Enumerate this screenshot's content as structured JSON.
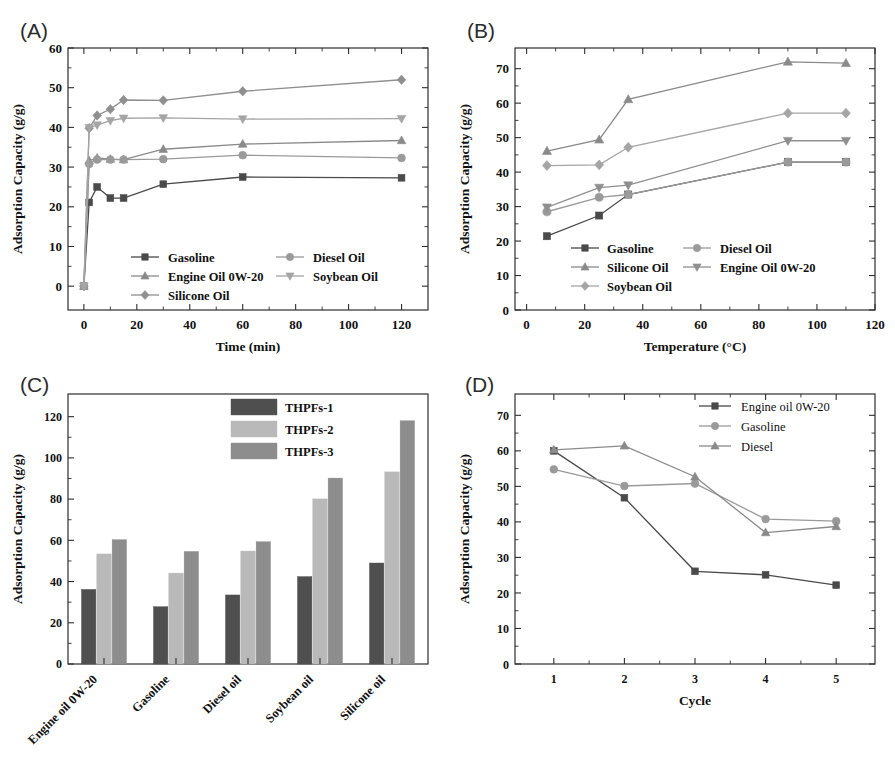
{
  "figure": {
    "panel_labels": {
      "a": "(A)",
      "b": "(B)",
      "c": "(C)",
      "d": "(D)"
    }
  },
  "colors": {
    "gasoline": "#4a4a4a",
    "engine_oil": "#8a8a8a",
    "silicone_oil": "#8f8f8f",
    "diesel_oil": "#9a9a9a",
    "soybean_oil": "#a5a5a5",
    "thpfs1": "#4f4f4f",
    "thpfs2": "#b9b9b9",
    "thpfs3": "#8d8d8d",
    "axis": "#2e2e2e",
    "panel_label": "#2b2b2b"
  },
  "chart_data": [
    {
      "id": "A",
      "type": "line",
      "title": "(A)",
      "xlabel": "Time (min)",
      "ylabel": "Adsorption Capacity (g/g)",
      "xlim": [
        -6,
        130
      ],
      "ylim": [
        -6,
        60
      ],
      "xticks": [
        0,
        20,
        40,
        60,
        80,
        100,
        120
      ],
      "yticks": [
        0,
        10,
        20,
        30,
        40,
        50,
        60
      ],
      "grid": false,
      "legend_position": "inside-bottom",
      "x": [
        0,
        2,
        5,
        10,
        15,
        30,
        60,
        120
      ],
      "series": [
        {
          "name": "Gasoline",
          "marker": "square",
          "color": "#4a4a4a",
          "values": [
            0,
            21.1,
            25.0,
            22.2,
            22.2,
            25.7,
            27.5,
            27.3
          ]
        },
        {
          "name": "Engine Oil 0W-20",
          "marker": "triangle",
          "color": "#8a8a8a",
          "values": [
            0,
            31.6,
            32.3,
            32.0,
            31.9,
            34.5,
            35.8,
            36.7
          ]
        },
        {
          "name": "Silicone Oil",
          "marker": "diamond",
          "color": "#8f8f8f",
          "values": [
            0,
            39.8,
            43.0,
            44.6,
            46.9,
            46.8,
            49.1,
            52.0
          ]
        },
        {
          "name": "Diesel Oil",
          "marker": "circle",
          "color": "#9a9a9a",
          "values": [
            0,
            30.8,
            31.9,
            31.9,
            31.9,
            32.0,
            33.0,
            32.3
          ]
        },
        {
          "name": "Soybean Oil",
          "marker": "dtriangle",
          "color": "#a5a5a5",
          "values": [
            0,
            39.9,
            40.6,
            41.7,
            42.3,
            42.4,
            42.1,
            42.2
          ]
        }
      ]
    },
    {
      "id": "B",
      "type": "line",
      "title": "(B)",
      "xlabel": "Temperature (°C)",
      "ylabel": "Adsorption Capacity (g/g)",
      "xlim": [
        -4,
        120
      ],
      "ylim": [
        0,
        76
      ],
      "xticks": [
        0,
        20,
        40,
        60,
        80,
        100,
        120
      ],
      "yticks": [
        0,
        10,
        20,
        30,
        40,
        50,
        60,
        70
      ],
      "grid": false,
      "legend_position": "inside-bottom",
      "x": [
        7,
        25,
        35,
        90,
        110
      ],
      "series": [
        {
          "name": "Gasoline",
          "marker": "square",
          "color": "#4a4a4a",
          "values": [
            21.4,
            27.4,
            33.5,
            42.9,
            42.9
          ]
        },
        {
          "name": "Silicone Oil",
          "marker": "triangle",
          "color": "#8a8a8a",
          "values": [
            46.1,
            49.4,
            61.1,
            72.0,
            71.6
          ]
        },
        {
          "name": "Soybean Oil",
          "marker": "diamond",
          "color": "#a5a5a5",
          "values": [
            41.9,
            42.1,
            47.2,
            57.1,
            57.1
          ]
        },
        {
          "name": "Diesel Oil",
          "marker": "circle",
          "color": "#9a9a9a",
          "values": [
            28.5,
            32.7,
            33.5,
            42.9,
            42.9
          ]
        },
        {
          "name": "Engine Oil 0W-20",
          "marker": "dtriangle",
          "color": "#8f8f8f",
          "values": [
            29.8,
            35.5,
            36.2,
            49.1,
            49.1
          ]
        }
      ]
    },
    {
      "id": "C",
      "type": "bar",
      "title": "(C)",
      "xlabel": "",
      "ylabel": "Adsorption Capacity (g/g)",
      "ylim": [
        0,
        131
      ],
      "yticks": [
        0,
        20,
        40,
        60,
        80,
        100,
        120
      ],
      "grid": false,
      "legend_position": "top-right",
      "categories": [
        "Engine oil 0W-20",
        "Gasoline",
        "Diesel oil",
        "Soybean oil",
        "Silicone oil"
      ],
      "series": [
        {
          "name": "THPFs-1",
          "color": "#4f4f4f",
          "values": [
            36.2,
            27.8,
            33.5,
            42.4,
            49.0
          ]
        },
        {
          "name": "THPFs-2",
          "color": "#b9b9b9",
          "values": [
            53.4,
            44.1,
            54.8,
            80.1,
            93.2
          ]
        },
        {
          "name": "THPFs-3",
          "color": "#8d8d8d",
          "values": [
            60.3,
            54.6,
            59.3,
            90.2,
            118.0
          ]
        }
      ]
    },
    {
      "id": "D",
      "type": "line",
      "title": "(D)",
      "xlabel": "Cycle",
      "ylabel": "Adsorption Capacity (g/g)",
      "xlim": [
        0.45,
        5.55
      ],
      "ylim": [
        0,
        76
      ],
      "xticks": [
        1,
        2,
        3,
        4,
        5
      ],
      "yticks": [
        0,
        10,
        20,
        30,
        40,
        50,
        60,
        70
      ],
      "grid": false,
      "legend_position": "top-right",
      "x": [
        1,
        2,
        3,
        4,
        5
      ],
      "series": [
        {
          "name": "Engine oil 0W-20",
          "marker": "square",
          "color": "#4a4a4a",
          "values": [
            60.0,
            46.8,
            26.1,
            25.1,
            22.2
          ]
        },
        {
          "name": "Gasoline",
          "marker": "circle",
          "color": "#9a9a9a",
          "values": [
            54.8,
            50.1,
            50.8,
            40.8,
            40.2
          ]
        },
        {
          "name": "Diesel",
          "marker": "triangle",
          "color": "#8a8a8a",
          "values": [
            60.3,
            61.4,
            52.7,
            37.0,
            38.7
          ]
        }
      ]
    }
  ]
}
